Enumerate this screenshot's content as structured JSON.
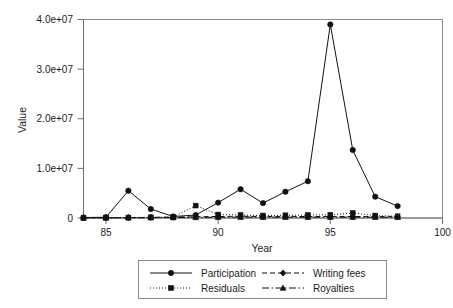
{
  "chart_data": {
    "type": "line",
    "title": "",
    "xlabel": "Year",
    "ylabel": "Value",
    "xlim": [
      84,
      100
    ],
    "ylim": [
      0,
      40000000
    ],
    "xticks": [
      85,
      90,
      95,
      100
    ],
    "xtick_labels": [
      "85",
      "90",
      "95",
      "100"
    ],
    "yticks": [
      0,
      10000000,
      20000000,
      30000000,
      40000000
    ],
    "ytick_labels": [
      "0",
      "1.0e+07",
      "2.0e+07",
      "3.0e+07",
      "4.0e+07"
    ],
    "grid": false,
    "legend_position": "bottom",
    "x": [
      84,
      85,
      86,
      87,
      88,
      89,
      90,
      91,
      92,
      93,
      94,
      95,
      96,
      97,
      98
    ],
    "series": [
      {
        "name": "Participation",
        "marker": "circle",
        "linestyle": "solid",
        "color": "#111111",
        "values": [
          100000,
          150000,
          5500000,
          1800000,
          300000,
          600000,
          3100000,
          5800000,
          3000000,
          5300000,
          7400000,
          39000000,
          13700000,
          4300000,
          2400000
        ]
      },
      {
        "name": "Residuals",
        "marker": "square",
        "linestyle": "dotted",
        "color": "#111111",
        "values": [
          60000,
          80000,
          100000,
          150000,
          200000,
          2500000,
          700000,
          600000,
          500000,
          550000,
          600000,
          650000,
          1000000,
          500000,
          350000
        ]
      },
      {
        "name": "Writing fees",
        "marker": "diamond",
        "linestyle": "dashed",
        "color": "#111111",
        "values": [
          40000,
          50000,
          60000,
          120000,
          180000,
          250000,
          300000,
          350000,
          300000,
          330000,
          300000,
          320000,
          300000,
          280000,
          250000
        ]
      },
      {
        "name": "Royalties",
        "marker": "triangle",
        "linestyle": "dashdot",
        "color": "#111111",
        "values": [
          30000,
          35000,
          40000,
          60000,
          90000,
          120000,
          150000,
          180000,
          160000,
          170000,
          165000,
          175000,
          170000,
          160000,
          150000
        ]
      }
    ]
  },
  "axes": {
    "x_title": "Year",
    "y_title": "Value"
  },
  "legend": {
    "entries": [
      {
        "label": "Participation",
        "marker": "circle-marker",
        "linestyle": "solid"
      },
      {
        "label": "Writing fees",
        "marker": "diamond-marker",
        "linestyle": "dashed"
      },
      {
        "label": "Residuals",
        "marker": "square-marker",
        "linestyle": "dotted"
      },
      {
        "label": "Royalties",
        "marker": "triangle-marker",
        "linestyle": "dashdot"
      }
    ]
  },
  "ticks": {
    "x": [
      "85",
      "90",
      "95",
      "100"
    ],
    "y": [
      "4.0e+07",
      "3.0e+07",
      "2.0e+07",
      "1.0e+07",
      "0"
    ]
  }
}
